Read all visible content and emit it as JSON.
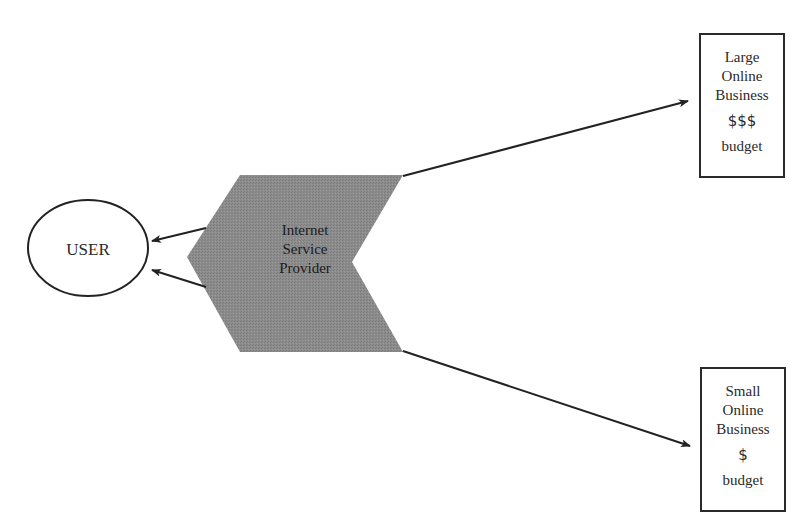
{
  "diagram": {
    "user": {
      "label": "USER"
    },
    "isp": {
      "label_lines": [
        "Internet",
        "Service",
        "Provider"
      ],
      "fill_color": "#8a8a8a"
    },
    "businesses": [
      {
        "id": "large",
        "lines": [
          "Large",
          "Online",
          "Business"
        ],
        "budget_symbol": "$$$",
        "budget_label": "budget"
      },
      {
        "id": "small",
        "lines": [
          "Small",
          "Online",
          "Business"
        ],
        "budget_symbol": "$",
        "budget_label": "budget"
      }
    ],
    "connections": [
      {
        "from": "isp",
        "to": "user",
        "arrow": true
      },
      {
        "from": "isp",
        "to": "user",
        "arrow": true
      },
      {
        "from": "isp",
        "to": "large",
        "arrow": true
      },
      {
        "from": "isp",
        "to": "small",
        "arrow": true
      }
    ],
    "colors": {
      "stroke": "#222222",
      "shape_fill": "#8a8a8a",
      "background": "#ffffff"
    }
  }
}
